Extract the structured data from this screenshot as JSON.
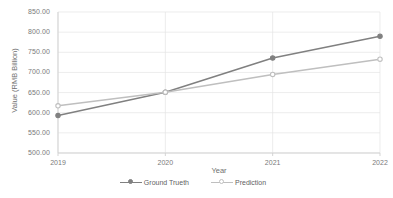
{
  "chart_data": {
    "type": "line",
    "title": "",
    "xlabel": "Year",
    "ylabel": "Value (RMB Billion)",
    "categories": [
      "2019",
      "2020",
      "2021",
      "2022"
    ],
    "x": [
      2019,
      2020,
      2021,
      2022
    ],
    "ylim": [
      500.0,
      850.0
    ],
    "ytick_labels": [
      "500.00",
      "550.00",
      "600.00",
      "650.00",
      "700.00",
      "750.00",
      "800.00",
      "850.00"
    ],
    "ytick_values": [
      500,
      550,
      600,
      650,
      700,
      750,
      800,
      850
    ],
    "grid": true,
    "grid_axis": "both",
    "legend_position": "bottom",
    "series": [
      {
        "name": "Ground Trueth",
        "values": [
          593.0,
          651.0,
          736.0,
          790.0
        ],
        "color": "#808080",
        "marker": "circle"
      },
      {
        "name": "Prediction",
        "values": [
          617.0,
          651.0,
          695.0,
          733.0
        ],
        "color": "#bfbfbf",
        "marker": "circle"
      }
    ]
  },
  "axis": {
    "y_title": "Value (RMB Billion)",
    "x_title": "Year"
  },
  "legend": {
    "items": [
      {
        "label": "Ground Trueth"
      },
      {
        "label": "Prediction"
      }
    ]
  },
  "colors": {
    "ground_truth": "#808080",
    "prediction": "#bfbfbf",
    "grid": "#e4e4e4",
    "axis_line": "#d0d0d0",
    "tick_text": "#7a7a7a",
    "background": "#ffffff"
  }
}
